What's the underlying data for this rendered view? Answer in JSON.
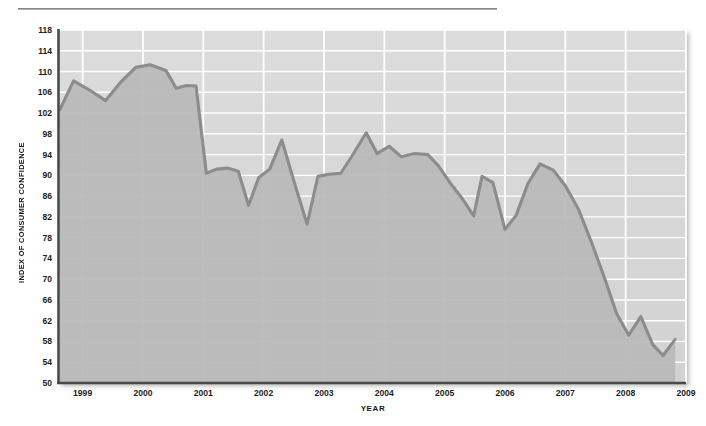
{
  "figure": {
    "y_axis_title": "INDEX OF CONSUMER CONFIDENCE",
    "x_axis_title": "YEAR",
    "line_color": "#8b8b8b",
    "fill_color": "#b8b8b8",
    "panel_color": "#d6d6d6",
    "grid_color": "#ffffff",
    "axis_color": "#4a4a4a"
  },
  "chart_data": {
    "type": "line",
    "title": "",
    "subtitle": "",
    "xlabel": "YEAR",
    "ylabel": "INDEX OF CONSUMER CONFIDENCE",
    "xlim": [
      1998.6,
      2009.0
    ],
    "ylim": [
      50,
      118
    ],
    "ytick_labels": [
      50,
      54,
      58,
      62,
      66,
      70,
      74,
      78,
      82,
      86,
      90,
      94,
      98,
      102,
      106,
      110,
      114,
      118
    ],
    "xtick_labels": [
      1999,
      2000,
      2001,
      2002,
      2003,
      2004,
      2005,
      2006,
      2007,
      2008,
      2009
    ],
    "grid": true,
    "legend": "none",
    "annotations": [],
    "series": [
      {
        "name": "Index of Consumer Confidence",
        "x": [
          1998.62,
          1998.85,
          1999.12,
          1999.38,
          1999.62,
          1999.88,
          2000.12,
          2000.38,
          2000.55,
          2000.72,
          2000.88,
          2001.05,
          2001.22,
          2001.4,
          2001.58,
          2001.75,
          2001.92,
          2002.1,
          2002.3,
          2002.52,
          2002.72,
          2002.9,
          2003.08,
          2003.28,
          2003.5,
          2003.7,
          2003.88,
          2004.08,
          2004.28,
          2004.5,
          2004.72,
          2004.9,
          2005.1,
          2005.3,
          2005.48,
          2005.62,
          2005.8,
          2006.0,
          2006.18,
          2006.38,
          2006.58,
          2006.8,
          2007.0,
          2007.22,
          2007.45,
          2007.65,
          2007.85,
          2008.05,
          2008.25,
          2008.45,
          2008.62,
          2008.82
        ],
        "y": [
          102.6,
          108.2,
          106.4,
          104.4,
          107.8,
          110.8,
          111.3,
          110.2,
          106.8,
          107.3,
          107.2,
          90.4,
          91.2,
          91.4,
          90.8,
          84.2,
          89.6,
          91.2,
          96.8,
          88.2,
          80.6,
          89.8,
          90.2,
          90.4,
          94.4,
          98.2,
          94.2,
          95.6,
          93.6,
          94.2,
          94.0,
          91.8,
          88.4,
          85.4,
          82.2,
          89.8,
          88.6,
          79.6,
          82.2,
          88.4,
          92.2,
          91.0,
          88.0,
          83.4,
          76.6,
          70.2,
          63.4,
          59.2,
          62.8,
          57.4,
          55.3,
          58.4
        ]
      }
    ]
  }
}
